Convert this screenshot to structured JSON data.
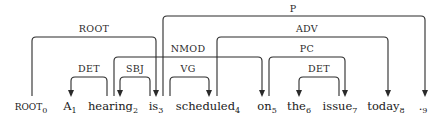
{
  "diagram": {
    "type": "dependency-parse",
    "tokens": [
      {
        "index": 0,
        "word": "ROOT",
        "sub": "0",
        "x": 31
      },
      {
        "index": 1,
        "word": "A",
        "sub": "1",
        "x": 70
      },
      {
        "index": 2,
        "word": "hearing",
        "sub": "2",
        "x": 113
      },
      {
        "index": 3,
        "word": "is",
        "sub": "3",
        "x": 156
      },
      {
        "index": 4,
        "word": "scheduled",
        "sub": "4",
        "x": 208
      },
      {
        "index": 5,
        "word": "on",
        "sub": "5",
        "x": 267
      },
      {
        "index": 6,
        "word": "the",
        "sub": "6",
        "x": 299
      },
      {
        "index": 7,
        "word": "issue",
        "sub": "7",
        "x": 340
      },
      {
        "index": 8,
        "word": "today",
        "sub": "8",
        "x": 386
      },
      {
        "index": 9,
        "word": ".",
        "sub": "9",
        "x": 423
      }
    ],
    "arcs": [
      {
        "label": "ROOT",
        "head": 0,
        "dependent": 3,
        "from_x": 32,
        "to_x": 156,
        "top_y": 37,
        "label_x": 94,
        "label_y": 32
      },
      {
        "label": "P",
        "head": 3,
        "dependent": 9,
        "from_x": 163,
        "to_x": 425,
        "top_y": 16,
        "label_x": 293,
        "label_y": 12
      },
      {
        "label": "ADV",
        "head": 4,
        "dependent": 8,
        "from_x": 217,
        "to_x": 388,
        "top_y": 37,
        "label_x": 307,
        "label_y": 32
      },
      {
        "label": "NMOD",
        "head": 5,
        "dependent": 2,
        "from_x": 114,
        "to_x": 262,
        "top_y": 57,
        "label_x": 188,
        "label_y": 52
      },
      {
        "label": "PC",
        "head": 5,
        "dependent": 7,
        "from_x": 269,
        "to_x": 345,
        "top_y": 57,
        "label_x": 307,
        "label_y": 52
      },
      {
        "label": "DET",
        "head": 2,
        "dependent": 1,
        "from_x": 107,
        "to_x": 71,
        "top_y": 77,
        "label_x": 89,
        "label_y": 72
      },
      {
        "label": "SBJ",
        "head": 3,
        "dependent": 2,
        "from_x": 150,
        "to_x": 120,
        "top_y": 77,
        "label_x": 135,
        "label_y": 72
      },
      {
        "label": "VG",
        "head": 3,
        "dependent": 4,
        "from_x": 170,
        "to_x": 209,
        "top_y": 77,
        "label_x": 188,
        "label_y": 72
      },
      {
        "label": "DET",
        "head": 7,
        "dependent": 6,
        "from_x": 339,
        "to_x": 299,
        "top_y": 77,
        "label_x": 319,
        "label_y": 72
      }
    ],
    "baseline_y": 97,
    "word_y": 110,
    "colors": {
      "line": "#2a2a2a",
      "text": "#1a1a1a",
      "background": "#ffffff"
    }
  }
}
